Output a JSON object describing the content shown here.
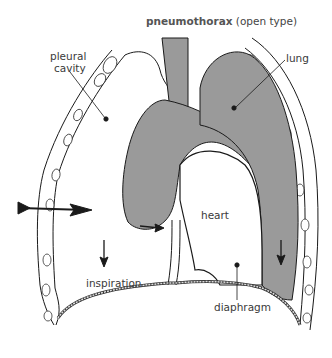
{
  "diagram": {
    "title_bold": "pneumothorax",
    "title_rest": " (open type)",
    "labels": {
      "pleural_cavity_line1": "pleural",
      "pleural_cavity_line2": "cavity",
      "lung": "lung",
      "heart": "heart",
      "inspiration": "inspiration",
      "diaphragm": "diaphragm"
    },
    "colors": {
      "lung_fill": "#9a9a9a",
      "line": "#1a1a1a",
      "text": "#3a3a3a",
      "background": "#ffffff"
    }
  }
}
